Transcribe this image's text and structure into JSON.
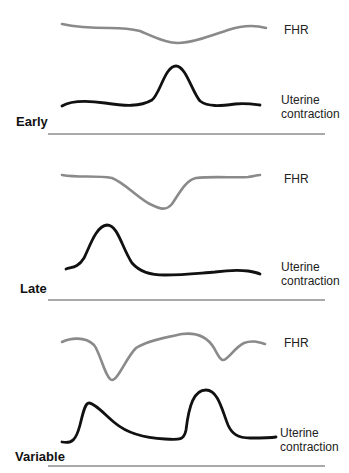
{
  "colors": {
    "fhr_trace": "#8a8a8a",
    "contraction_trace": "#111111",
    "divider": "#555555",
    "text": "#222222"
  },
  "panels": [
    {
      "pattern": "Early",
      "fhr_label": "FHR",
      "contraction_label_line1": "Uterine",
      "contraction_label_line2": "contraction"
    },
    {
      "pattern": "Late",
      "fhr_label": "FHR",
      "contraction_label_line1": "Uterine",
      "contraction_label_line2": "contraction"
    },
    {
      "pattern": "Variable",
      "fhr_label": "FHR",
      "contraction_label_line1": "Uterine",
      "contraction_label_line2": "contraction"
    }
  ]
}
